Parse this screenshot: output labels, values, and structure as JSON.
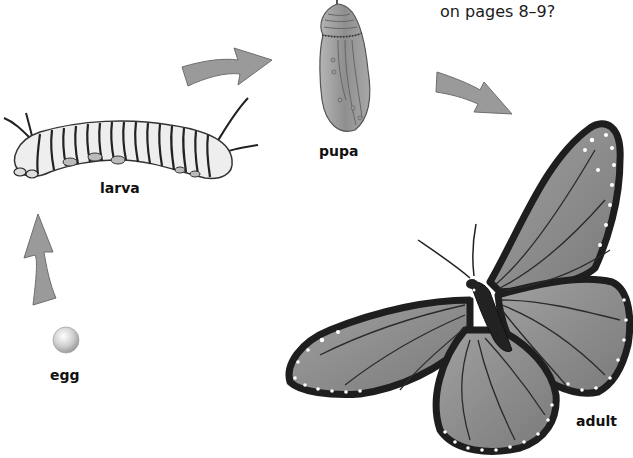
{
  "header": {
    "text": "on pages 8–9?"
  },
  "stages": [
    {
      "id": "egg",
      "label": "egg"
    },
    {
      "id": "larva",
      "label": "larva"
    },
    {
      "id": "pupa",
      "label": "pupa"
    },
    {
      "id": "adult",
      "label": "adult"
    }
  ],
  "arrows": [
    {
      "from": "egg",
      "to": "larva",
      "direction": "up"
    },
    {
      "from": "larva",
      "to": "pupa",
      "direction": "right"
    },
    {
      "from": "pupa",
      "to": "adult",
      "direction": "down-right"
    }
  ],
  "colors": {
    "arrow_fill": "#9a9a9a",
    "arrow_stroke": "#6e6e6e",
    "wing_fill": "#8c8c8c",
    "wing_border": "#1e1e1e",
    "spot": "#ffffff"
  }
}
